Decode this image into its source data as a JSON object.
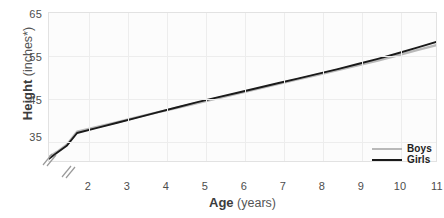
{
  "chart_data": {
    "type": "line",
    "title": "",
    "xlabel_bold": "Age",
    "xlabel_unit": "(years)",
    "ylabel_bold": "Height",
    "ylabel_unit": "(inches*)",
    "xlim": [
      1.3,
      11
    ],
    "ylim": [
      30,
      65
    ],
    "xticks": [
      2,
      3,
      4,
      5,
      6,
      7,
      8,
      9,
      10,
      11
    ],
    "yticks": [
      35,
      45,
      55,
      65
    ],
    "x_axis_broken": true,
    "y_axis_broken": true,
    "grid": true,
    "legend_position": "bottom-right",
    "x": [
      1.3,
      1.5,
      1.75,
      2,
      2.5,
      3,
      3.5,
      4,
      4.5,
      5,
      5.5,
      6,
      6.5,
      7,
      7.5,
      8,
      8.5,
      9,
      9.5,
      10,
      10.5,
      11
    ],
    "series": [
      {
        "name": "Boys",
        "color": "#b9b9b9",
        "values": [
          31.4,
          32.6,
          34.3,
          37.3,
          38.4,
          39.5,
          40.7,
          41.8,
          42.9,
          44.0,
          45.1,
          46.2,
          47.3,
          48.4,
          49.5,
          50.6,
          51.7,
          52.8,
          53.9,
          55.1,
          56.4,
          57.6
        ]
      },
      {
        "name": "Girls",
        "color": "#1a1a1a",
        "values": [
          31.0,
          32.4,
          34.1,
          37.0,
          38.2,
          39.4,
          40.6,
          41.8,
          43.0,
          44.2,
          45.3,
          46.4,
          47.5,
          48.6,
          49.7,
          50.8,
          51.9,
          53.1,
          54.3,
          55.6,
          57.0,
          58.4
        ]
      }
    ]
  },
  "legend": {
    "items": [
      {
        "label": "Boys",
        "color": "#b9b9b9"
      },
      {
        "label": "Girls",
        "color": "#1a1a1a"
      }
    ]
  },
  "axis": {
    "y_ticks": [
      "65",
      "55",
      "45",
      "35"
    ],
    "x_ticks": [
      "2",
      "3",
      "4",
      "5",
      "6",
      "7",
      "8",
      "9",
      "10",
      "11"
    ],
    "y_title_bold": "Height",
    "y_title_unit": "(inches*)",
    "x_title_bold": "Age",
    "x_title_unit": "(years)"
  }
}
